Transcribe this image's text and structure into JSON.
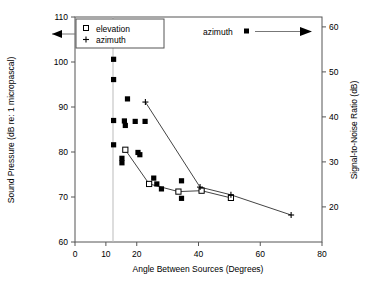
{
  "chart_data": {
    "type": "scatter",
    "title": "",
    "xlabel": "Angle Between Sources (Degrees)",
    "ylabel": "Sound Pressure (dB re: 1 micropascal)",
    "y2label": "Signal-to-Noise Ratio (dB)",
    "xlim": [
      0,
      80
    ],
    "ylim": [
      60,
      110
    ],
    "y2lim": [
      12.2,
      62.2
    ],
    "xticks": [
      0,
      10,
      20,
      40,
      60,
      80
    ],
    "xticklabels": [
      "0",
      "10",
      "20",
      "40",
      "60",
      "80"
    ],
    "yticks": [
      60,
      70,
      80,
      90,
      100,
      110
    ],
    "yticklabels": [
      "60",
      "70",
      "80",
      "90",
      "100",
      "110"
    ],
    "y2ticks": [
      20,
      30,
      40,
      50,
      60
    ],
    "y2ticklabels": [
      "20",
      "30",
      "40",
      "50",
      "60"
    ],
    "grid": false,
    "vertical_reference_line_x": 12.5,
    "legend": {
      "position": "top-left-inside",
      "entries": [
        {
          "label": "elevation",
          "marker": "open-square"
        },
        {
          "label": "azimuth",
          "marker": "plus"
        }
      ]
    },
    "annotations": [
      {
        "text": "",
        "type": "left-arrow",
        "points_to": "left-axis",
        "note": "arrow from legend box to left axis"
      },
      {
        "text": "azimuth",
        "type": "right-arrow",
        "marker": "filled-square",
        "points_to": "right-axis"
      }
    ],
    "series": [
      {
        "name": "azimuth-snr",
        "axis": "right",
        "marker": "filled-square",
        "points": [
          {
            "x": 12.5,
            "y": 100.6
          },
          {
            "x": 12.5,
            "y": 96.1
          },
          {
            "x": 12.5,
            "y": 87.0
          },
          {
            "x": 12.5,
            "y": 81.6
          },
          {
            "x": 15.2,
            "y": 77.6
          },
          {
            "x": 15.2,
            "y": 78.6
          },
          {
            "x": 17.0,
            "y": 91.8
          },
          {
            "x": 16.0,
            "y": 86.9
          },
          {
            "x": 16.3,
            "y": 85.9
          },
          {
            "x": 19.5,
            "y": 86.8
          },
          {
            "x": 21.0,
            "y": 79.4
          },
          {
            "x": 20.4,
            "y": 79.9
          },
          {
            "x": 22.7,
            "y": 86.8
          },
          {
            "x": 25.5,
            "y": 74.2
          },
          {
            "x": 26.5,
            "y": 72.9
          },
          {
            "x": 28.0,
            "y": 71.8
          },
          {
            "x": 34.5,
            "y": 73.6
          },
          {
            "x": 34.5,
            "y": 69.7
          },
          {
            "x": 41.0,
            "y": 71.5
          },
          {
            "x": 50.5,
            "y": 69.9
          }
        ]
      },
      {
        "name": "elevation",
        "axis": "left",
        "marker": "open-square",
        "line": true,
        "points": [
          {
            "x": 16.3,
            "y": 80.5
          },
          {
            "x": 24.0,
            "y": 72.9
          },
          {
            "x": 33.5,
            "y": 71.2
          },
          {
            "x": 41.0,
            "y": 71.4
          },
          {
            "x": 50.5,
            "y": 69.8
          }
        ]
      },
      {
        "name": "azimuth",
        "axis": "left",
        "marker": "plus",
        "line": true,
        "points": [
          {
            "x": 22.8,
            "y": 91.1
          },
          {
            "x": 40.5,
            "y": 72.2
          },
          {
            "x": 50.5,
            "y": 70.5
          },
          {
            "x": 70.0,
            "y": 66.0
          }
        ]
      }
    ]
  }
}
